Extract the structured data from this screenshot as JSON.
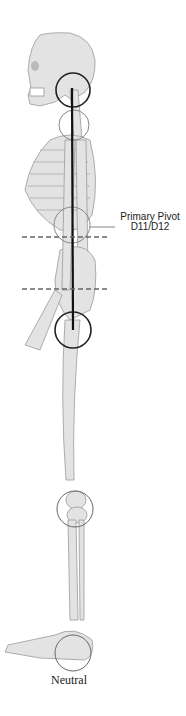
{
  "diagram": {
    "type": "anatomical-skeleton-lateral-view",
    "labels": {
      "pivot_line1": "Primary Pivot",
      "pivot_line2": "D11/D12",
      "caption": "Neutral"
    },
    "colors": {
      "bone_fill": "#e3e3e3",
      "bone_stroke": "#9a9a9a",
      "plumb_line": "#111111",
      "circle_primary": "#222222",
      "circle_secondary": "#888888",
      "dashed_line": "#666666"
    },
    "joints": [
      "atlas-occiput",
      "cervicothoracic",
      "D11/D12",
      "hip",
      "knee",
      "ankle"
    ]
  }
}
